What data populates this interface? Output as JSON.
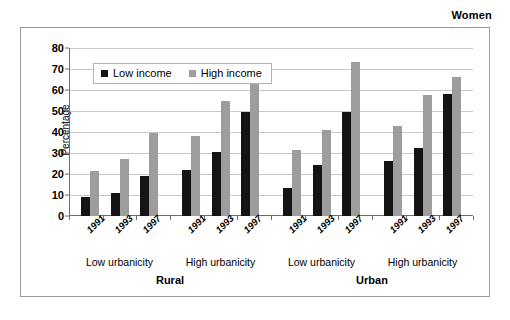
{
  "super_title": "Women",
  "chart_data": {
    "type": "bar",
    "title": "Women",
    "xlabel": "",
    "ylabel": "Percentage",
    "ylim": [
      0,
      80
    ],
    "ytick_step": 10,
    "yticks": [
      80,
      70,
      60,
      50,
      40,
      30,
      20,
      10,
      0
    ],
    "grid": true,
    "legend_position": "top-left inside plot",
    "categories": [
      "1991",
      "1993",
      "1997"
    ],
    "group_levels": {
      "area": [
        "Rural",
        "Urban"
      ],
      "urbanicity": [
        "Low urbanicity",
        "High urbanicity"
      ]
    },
    "series": [
      {
        "name": "Low income",
        "color": "#141414"
      },
      {
        "name": "High income",
        "color": "#9d9d9d"
      }
    ],
    "groups": [
      {
        "area": "Rural",
        "urbanicity": "Low urbanicity",
        "bars": [
          {
            "year": "1991",
            "low_income": 9,
            "high_income": 21.5
          },
          {
            "year": "1993",
            "low_income": 11,
            "high_income": 27
          },
          {
            "year": "1997",
            "low_income": 19,
            "high_income": 39.5
          }
        ]
      },
      {
        "area": "Rural",
        "urbanicity": "High urbanicity",
        "bars": [
          {
            "year": "1991",
            "low_income": 22,
            "high_income": 38
          },
          {
            "year": "1993",
            "low_income": 30.5,
            "high_income": 55
          },
          {
            "year": "1997",
            "low_income": 49.5,
            "high_income": 70
          }
        ]
      },
      {
        "area": "Urban",
        "urbanicity": "Low urbanicity",
        "bars": [
          {
            "year": "1991",
            "low_income": 13.5,
            "high_income": 31.5
          },
          {
            "year": "1993",
            "low_income": 24.5,
            "high_income": 41
          },
          {
            "year": "1997",
            "low_income": 49.5,
            "high_income": 73.5
          }
        ]
      },
      {
        "area": "Urban",
        "urbanicity": "High urbanicity",
        "bars": [
          {
            "year": "1991",
            "low_income": 26,
            "high_income": 43
          },
          {
            "year": "1993",
            "low_income": 32.5,
            "high_income": 57.5
          },
          {
            "year": "1997",
            "low_income": 58,
            "high_income": 66
          }
        ]
      }
    ]
  },
  "legend": {
    "items": [
      {
        "label": "Low income",
        "color": "#141414"
      },
      {
        "label": "High income",
        "color": "#9d9d9d"
      }
    ]
  },
  "axis": {
    "y_title": "Percentage",
    "y_tick_labels": [
      "80",
      "70",
      "60",
      "50",
      "40",
      "30",
      "20",
      "10",
      "0"
    ]
  },
  "urbanicity_labels": [
    "Low urbanicity",
    "High urbanicity",
    "Low urbanicity",
    "High urbanicity"
  ],
  "area_labels": [
    "Rural",
    "Urban"
  ],
  "year_labels": [
    "1991",
    "1993",
    "1997"
  ],
  "colors": {
    "low_income": "#141414",
    "high_income": "#9d9d9d",
    "gridline": "#c8c8c8",
    "frame": "#9a9a9a",
    "axis": "#6e6e6e",
    "background": "#ffffff"
  }
}
